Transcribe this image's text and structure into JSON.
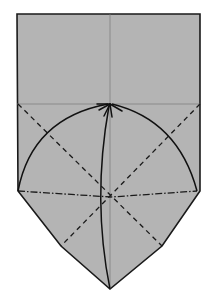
{
  "diagram": {
    "type": "origami-fold-step",
    "paper_color": "#b4b4b4",
    "outline_color": "#1a1a1a",
    "crease_color": "#7a7a7a",
    "line_color": "#111111",
    "outline_points": [
      [
        17,
        14
      ],
      [
        200,
        14
      ],
      [
        200,
        191
      ],
      [
        162,
        246
      ],
      [
        110,
        289
      ],
      [
        61,
        246
      ],
      [
        18,
        191
      ]
    ],
    "center_crease": {
      "x1": 110,
      "y1": 14,
      "x2": 110,
      "y2": 289
    },
    "horizontal_crease": {
      "x1": 17,
      "y1": 104,
      "x2": 200,
      "y2": 104
    },
    "valley_folds": [
      {
        "x1": 18,
        "y1": 104,
        "x2": 162,
        "y2": 246
      },
      {
        "x1": 200,
        "y1": 104,
        "x2": 61,
        "y2": 246
      }
    ],
    "mountain_fold": {
      "points": [
        [
          18,
          191
        ],
        [
          111,
          197
        ],
        [
          197,
          191
        ]
      ]
    },
    "arrows": [
      {
        "name": "left-corner-arrow",
        "from": [
          18,
          191
        ],
        "to": [
          110,
          104
        ]
      },
      {
        "name": "bottom-point-arrow",
        "from": [
          110,
          289
        ],
        "to": [
          110,
          104
        ]
      },
      {
        "name": "right-corner-arrow",
        "from": [
          197,
          191
        ],
        "to": [
          110,
          104
        ]
      }
    ],
    "target_point": [
      110,
      104
    ]
  }
}
